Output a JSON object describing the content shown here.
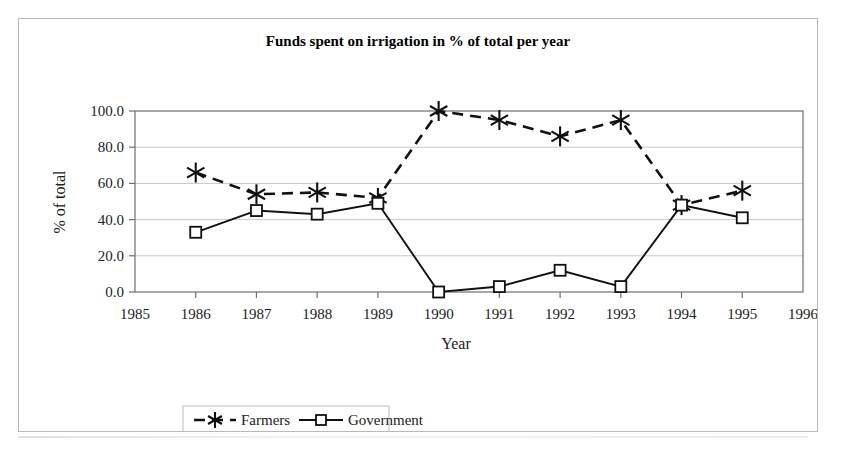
{
  "figure": {
    "title": "Funds spent on irrigation in % of total per year"
  },
  "chart_data": {
    "type": "line",
    "title": "Funds spent on irrigation in % of total per year",
    "xlabel": "Year",
    "ylabel": "% of total",
    "grid": true,
    "legend_position": "bottom",
    "x": [
      1986,
      1987,
      1988,
      1989,
      1990,
      1991,
      1992,
      1993,
      1994,
      1995
    ],
    "xtick_labels": [
      "1985",
      "1986",
      "1987",
      "1988",
      "1989",
      "1990",
      "1991",
      "1992",
      "1993",
      "1994",
      "1995",
      "1996"
    ],
    "xlim": [
      1985,
      1996
    ],
    "ytick_labels": [
      "0.0",
      "20.0",
      "40.0",
      "60.0",
      "80.0",
      "100.0"
    ],
    "yticks": [
      0,
      20,
      40,
      60,
      80,
      100
    ],
    "ylim": [
      0,
      100
    ],
    "series": [
      {
        "name": "Farmers",
        "marker": "asterisk",
        "linestyle": "dashed",
        "color": "#111111",
        "values": [
          66,
          54,
          55,
          52,
          100,
          95,
          86,
          95,
          48,
          56
        ]
      },
      {
        "name": "Government",
        "marker": "square",
        "linestyle": "solid",
        "color": "#111111",
        "values": [
          33,
          45,
          43,
          49,
          0,
          3,
          12,
          3,
          48,
          41
        ]
      }
    ]
  }
}
